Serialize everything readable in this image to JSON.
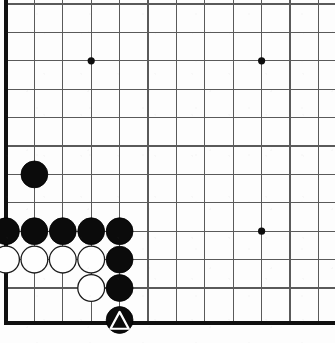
{
  "board": {
    "title": "Go board position",
    "game": "Go",
    "board_size": 19,
    "visible_region": "bottom-left corner",
    "colors": {
      "background": "#fdfdfd",
      "grid_line": "#5a5a5a",
      "edge_line": "#101010",
      "black_stone": "#0b0b0b",
      "white_stone": "#fefefe",
      "mark": "#ffffff"
    },
    "geometry": {
      "origin_x": 6,
      "origin_y": 4,
      "spacing": 28.4,
      "cols_visible": 12,
      "rows_visible": 12,
      "left_edge_x": 6,
      "bottom_edge_y": 323,
      "stone_radius": 13.4
    },
    "grid_x": [
      6,
      34.4,
      62.8,
      91.2,
      119.6,
      148,
      176.4,
      204.8,
      233.2,
      261.6,
      290,
      318.4
    ],
    "grid_y": [
      4,
      32.4,
      60.8,
      89.2,
      117.6,
      146,
      174.4,
      202.8,
      231.2,
      259.6,
      288,
      323
    ],
    "star_points": [
      {
        "name": "star-point-upper-left",
        "x": 91.2,
        "y": 60.8
      },
      {
        "name": "star-point-upper-right",
        "x": 261.6,
        "y": 60.8
      },
      {
        "name": "star-point-lower-right",
        "x": 261.6,
        "y": 231.2
      }
    ],
    "stones": [
      {
        "name": "black-stone-lone",
        "color": "black",
        "x": 34.4,
        "y": 174.4,
        "marked": false
      },
      {
        "name": "black-stone-row-a1",
        "color": "black",
        "x": 6,
        "y": 231.2,
        "marked": false
      },
      {
        "name": "black-stone-row-a2",
        "color": "black",
        "x": 34.4,
        "y": 231.2,
        "marked": false
      },
      {
        "name": "black-stone-row-a3",
        "color": "black",
        "x": 62.8,
        "y": 231.2,
        "marked": false
      },
      {
        "name": "black-stone-row-a4",
        "color": "black",
        "x": 91.2,
        "y": 231.2,
        "marked": false
      },
      {
        "name": "black-stone-row-a5",
        "color": "black",
        "x": 119.6,
        "y": 231.2,
        "marked": false
      },
      {
        "name": "white-stone-row-b1",
        "color": "white",
        "x": 6,
        "y": 259.6,
        "marked": false
      },
      {
        "name": "white-stone-row-b2",
        "color": "white",
        "x": 34.4,
        "y": 259.6,
        "marked": false
      },
      {
        "name": "white-stone-row-b3",
        "color": "white",
        "x": 62.8,
        "y": 259.6,
        "marked": false
      },
      {
        "name": "white-stone-row-b4",
        "color": "white",
        "x": 91.2,
        "y": 259.6,
        "marked": false
      },
      {
        "name": "black-stone-wall-c",
        "color": "black",
        "x": 119.6,
        "y": 259.6,
        "marked": false
      },
      {
        "name": "white-stone-lower-d",
        "color": "white",
        "x": 91.2,
        "y": 288,
        "marked": false
      },
      {
        "name": "black-stone-wall-d",
        "color": "black",
        "x": 119.6,
        "y": 288,
        "marked": false
      },
      {
        "name": "black-stone-marked-triangle",
        "color": "black",
        "x": 119.6,
        "y": 320,
        "marked": true
      }
    ],
    "marks": [
      {
        "name": "triangle-mark",
        "shape": "triangle",
        "on_stone": "black-stone-marked-triangle",
        "color": "#ffffff"
      }
    ]
  }
}
